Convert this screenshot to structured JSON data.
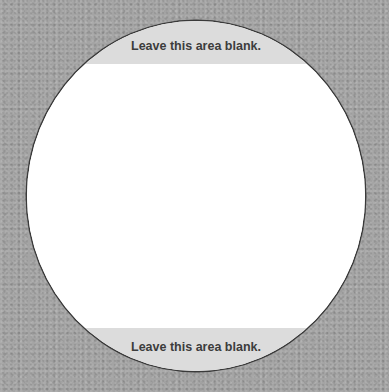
{
  "label": {
    "top_text": "Leave this area blank.",
    "bottom_text": "Leave this area blank."
  },
  "colors": {
    "background": "#a4a4a4",
    "disc": "#ffffff",
    "band": "#dcdcdc",
    "text": "#3c3c3c"
  }
}
